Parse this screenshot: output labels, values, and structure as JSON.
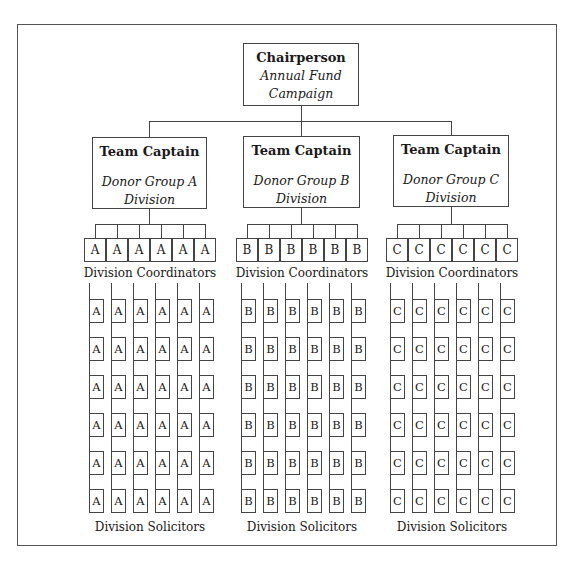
{
  "chart_data": {
    "type": "org_chart",
    "root": {
      "title": "Chairperson",
      "subtitle": "Annual Fund Campaign"
    },
    "divisions": [
      {
        "title": "Team Captain",
        "subtitle": "Donor Group A Division",
        "letter": "A",
        "coordinators_count": 6,
        "coordinators_label": "Division Coordinators",
        "solicitors_per_coordinator": 6,
        "solicitors_label": "Division Solicitors"
      },
      {
        "title": "Team Captain",
        "subtitle": "Donor Group B Division",
        "letter": "B",
        "coordinators_count": 6,
        "coordinators_label": "Division Coordinators",
        "solicitors_per_coordinator": 6,
        "solicitors_label": "Division Solicitors"
      },
      {
        "title": "Team Captain",
        "subtitle": "Donor Group C Division",
        "letter": "C",
        "coordinators_count": 6,
        "coordinators_label": "Division Coordinators",
        "solicitors_per_coordinator": 6,
        "solicitors_label": "Division Solicitors"
      }
    ]
  },
  "chair": {
    "title": "Chairperson",
    "line1": "Annual Fund",
    "line2": "Campaign"
  },
  "captains": [
    {
      "title": "Team Captain",
      "line1": "Donor Group A",
      "line2": "Division",
      "letter": "A",
      "coordinators_label": "Division Coordinators",
      "solicitors_label": "Division Solicitors"
    },
    {
      "title": "Team Captain",
      "line1": "Donor Group B",
      "line2": "Division",
      "letter": "B",
      "coordinators_label": "Division Coordinators",
      "solicitors_label": "Division Solicitors"
    },
    {
      "title": "Team Captain",
      "line1": "Donor Group C",
      "line2": "Division",
      "letter": "C",
      "coordinators_label": "Division Coordinators",
      "solicitors_label": "Division Solicitors"
    }
  ],
  "colors": {
    "line": "#444444",
    "text": "#1a1a1a",
    "background": "#ffffff"
  }
}
